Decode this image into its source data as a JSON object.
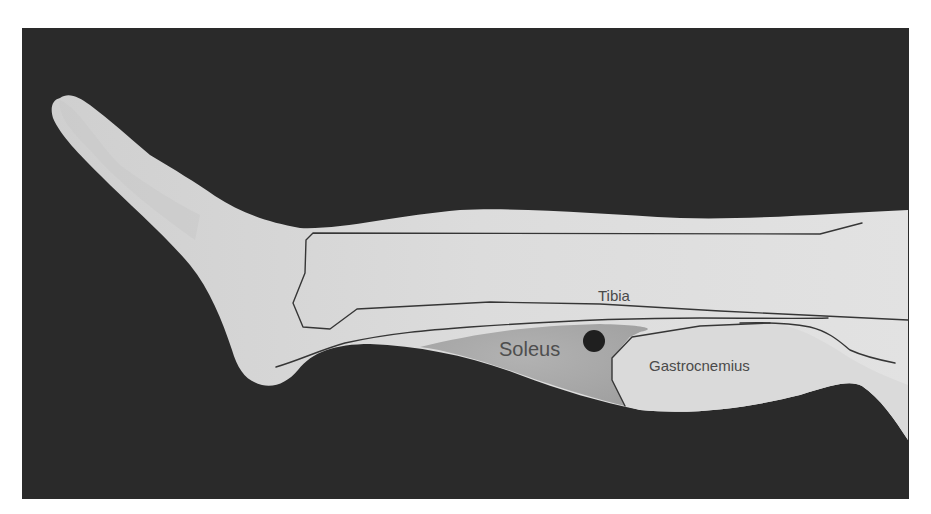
{
  "figure": {
    "labels": {
      "tibia": "Tibia",
      "soleus": "Soleus",
      "gastrocnemius": "Gastrocnemius"
    },
    "colors": {
      "background": "#2a2a2a",
      "skin": "#d6d6d6",
      "soleus_region": "#a9a9a9",
      "outline": "#3a3a3a",
      "marker": "#1e1e1e",
      "label_text": "#4a4a4a"
    },
    "marker": {
      "shape": "dot",
      "cx": 594,
      "cy": 341,
      "r": 11
    }
  }
}
